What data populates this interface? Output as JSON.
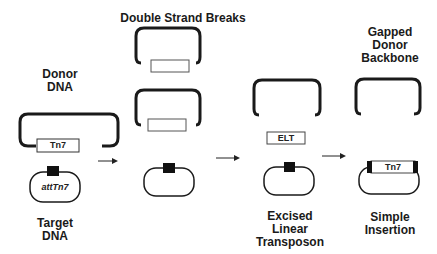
{
  "columns": [
    {
      "id": "donor",
      "top_label": [
        "Donor",
        "DNA"
      ],
      "bottom_label": [
        "Target",
        "DNA"
      ],
      "donor_insert_label": "Tn7",
      "target_site_label": "attTn7"
    },
    {
      "id": "dsb",
      "top_label": [
        "Double Strand Breaks"
      ]
    },
    {
      "id": "excised",
      "insert_label": "ELT",
      "bottom_label": [
        "Excised",
        "Linear",
        "Transposon"
      ]
    },
    {
      "id": "insertion",
      "top_label": [
        "Gapped",
        "Donor",
        "Backbone"
      ],
      "insert_label": "Tn7",
      "bottom_label": [
        "Simple",
        "Insertion"
      ]
    }
  ],
  "colors": {
    "line": "#1a1a1a",
    "site": "#111111",
    "background": "#ffffff"
  }
}
